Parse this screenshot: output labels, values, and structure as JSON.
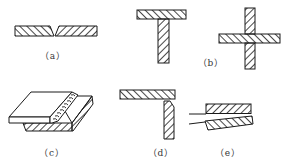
{
  "figure": {
    "stroke_color": "#1a1a1a",
    "background": "#ffffff",
    "panels": [
      {
        "id": "a",
        "label": "（a）",
        "description": "butt joint with beveled plates",
        "label_x": 53,
        "label_y": 49
      },
      {
        "id": "b",
        "label": "（b）",
        "description": "T-joint and cruciform joint",
        "label_x": 211,
        "label_y": 56
      },
      {
        "id": "c",
        "label": "（c）",
        "description": "lap joint (3D view with fillet weld)",
        "label_x": 52,
        "label_y": 146
      },
      {
        "id": "d",
        "label": "（d）",
        "description": "corner joint",
        "label_x": 161,
        "label_y": 146
      },
      {
        "id": "e",
        "label": "（e）",
        "description": "lap / edge joint",
        "label_x": 228,
        "label_y": 146
      }
    ]
  }
}
